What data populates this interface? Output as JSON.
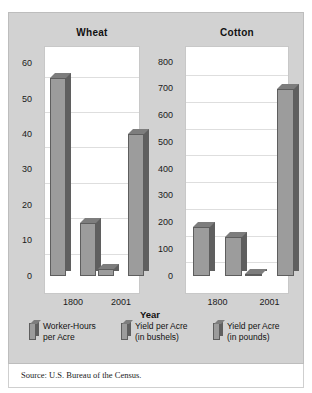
{
  "source_note": "Source: U.S. Bureau of the Census.",
  "axis_title": "Year",
  "panels": [
    {
      "title": "Wheat"
    },
    {
      "title": "Cotton"
    }
  ],
  "legend": [
    {
      "line1": "Worker-Hours",
      "line2": "per Acre"
    },
    {
      "line1": "Yield per Acre",
      "line2": "(in bushels)"
    },
    {
      "line1": "Yield per Acre",
      "line2": "(in pounds)"
    }
  ],
  "colors": {
    "panel_background": "#d2d2d2",
    "plot_background": "#ffffff",
    "bar_face": "#9c9c9c",
    "bar_side": "#5f5f5f",
    "bar_top": "#7d7d7d",
    "gridline": "#dedede",
    "text": "#111111"
  },
  "wheat_ticks": [
    "60",
    "50",
    "40",
    "30",
    "20",
    "10",
    "0"
  ],
  "cotton_ticks": [
    "800",
    "700",
    "600",
    "500",
    "400",
    "300",
    "200",
    "100",
    "0"
  ],
  "x_labels": [
    "1800",
    "2001"
  ],
  "chart_data": [
    {
      "type": "bar",
      "title": "Wheat",
      "xlabel": "Year",
      "ylabel": "",
      "categories": [
        "1800",
        "2001"
      ],
      "ylim": [
        0,
        65
      ],
      "yticks": [
        0,
        10,
        20,
        30,
        40,
        50,
        60
      ],
      "grid": true,
      "legend_position": "below",
      "series": [
        {
          "name": "Worker-Hours per Acre",
          "values": [
            56,
            2
          ]
        },
        {
          "name": "Yield per Acre (in bushels)",
          "values": [
            15,
            40
          ]
        }
      ]
    },
    {
      "type": "bar",
      "title": "Cotton",
      "xlabel": "Year",
      "ylabel": "",
      "categories": [
        "1800",
        "2001"
      ],
      "ylim": [
        0,
        860
      ],
      "yticks": [
        0,
        100,
        200,
        300,
        400,
        500,
        600,
        700,
        800
      ],
      "grid": true,
      "legend_position": "below",
      "series": [
        {
          "name": "Worker-Hours per Acre",
          "values": [
            185,
            8
          ]
        },
        {
          "name": "Yield per Acre (in pounds)",
          "values": [
            145,
            700
          ]
        }
      ]
    }
  ]
}
